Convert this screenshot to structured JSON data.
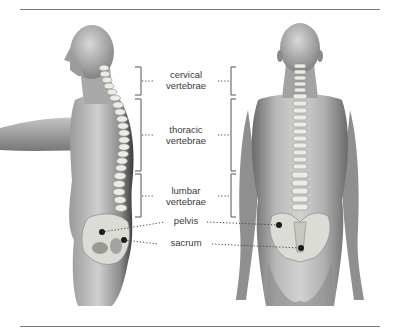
{
  "figure": {
    "views": [
      "side view",
      "back view"
    ],
    "labels": {
      "cervical": {
        "line1": "cervical",
        "line2": "vertebrae"
      },
      "thoracic": {
        "line1": "thoracic",
        "line2": "vertebrae"
      },
      "lumbar": {
        "line1": "lumbar",
        "line2": "vertebrae"
      },
      "pelvis": "pelvis",
      "sacrum": "sacrum"
    },
    "colors": {
      "text": "#3b3b3b",
      "rule": "#7a7a7a",
      "bracket": "#555555",
      "leader": "#444444",
      "marker": "#1a1a1a",
      "skin_dark": "#6e6e6e",
      "skin_light": "#d9d9d9",
      "bone": "#eeeeea"
    }
  }
}
